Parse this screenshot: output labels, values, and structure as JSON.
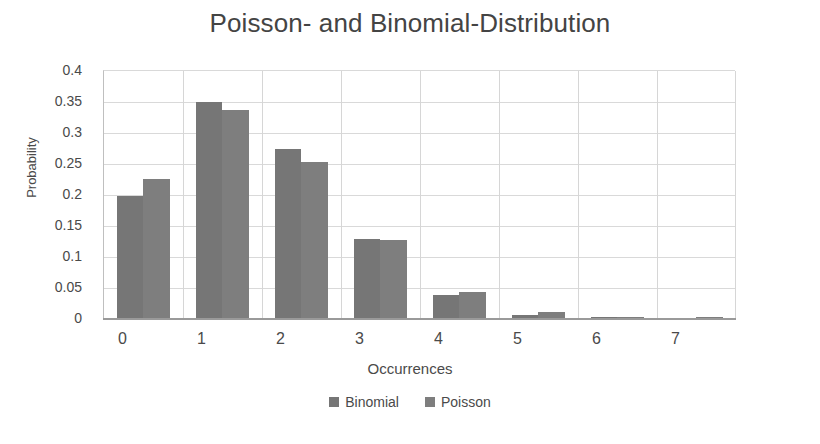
{
  "chart_data": {
    "type": "bar",
    "title": "Poisson- and Binomial-Distribution",
    "xlabel": "Occurrences",
    "ylabel": "Probability",
    "categories": [
      "0",
      "1",
      "2",
      "3",
      "4",
      "5",
      "6",
      "7"
    ],
    "series": [
      {
        "name": "Binomial",
        "color": "#767676",
        "values": [
          0.197,
          0.349,
          0.273,
          0.127,
          0.037,
          0.005,
          0.001,
          0.0
        ]
      },
      {
        "name": "Poisson",
        "color": "#7e7e7e",
        "values": [
          0.224,
          0.335,
          0.251,
          0.126,
          0.042,
          0.009,
          0.002,
          0.001
        ]
      }
    ],
    "ylim": [
      0,
      0.4
    ],
    "yticks": [
      "0",
      "0.05",
      "0.1",
      "0.15",
      "0.2",
      "0.25",
      "0.3",
      "0.35",
      "0.4"
    ],
    "ytick_values": [
      0,
      0.05,
      0.1,
      0.15,
      0.2,
      0.25,
      0.3,
      0.35,
      0.4
    ],
    "grid": "horizontal-and-vertical",
    "legend_position": "bottom",
    "gridline_color": "#d9d9d9",
    "axis_color": "#9a9a9a",
    "text_color": "#4a4a4a"
  }
}
